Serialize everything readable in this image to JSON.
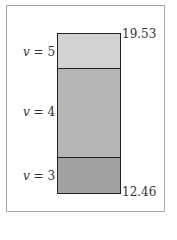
{
  "diagram": {
    "levels": [
      {
        "label_var": "v",
        "label_eq": " = 5",
        "color": "#d2d2d2"
      },
      {
        "label_var": "v",
        "label_eq": " = 4",
        "color": "#b6b6b6"
      },
      {
        "label_var": "v",
        "label_eq": " = 3",
        "color": "#a2a2a2"
      }
    ],
    "top_value": "19.53",
    "bottom_value": "12.46"
  }
}
